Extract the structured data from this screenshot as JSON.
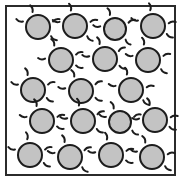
{
  "diagram": {
    "title": "",
    "particle_count": 18,
    "row_counts": [
      4,
      3,
      3,
      4,
      4
    ],
    "colors": {
      "background": "#ffffff",
      "container_fill": "#ffffff",
      "container_stroke": "#2b2b2b",
      "particle_fill": "#c3c3c3",
      "particle_stroke": "#1c1c1c",
      "vibration_mark": "#1c1c1c"
    },
    "container": {
      "x": 5,
      "y": 5,
      "width": 171,
      "height": 171,
      "stroke_width": 2
    },
    "particle_style": {
      "radius": 12,
      "stroke_width": 2
    },
    "vibration_style": {
      "mark_stroke_width": 2,
      "mark_length": 7,
      "marks_per_particle": 4
    },
    "particles": [
      {
        "id": "p1",
        "row": 1,
        "cx": 38,
        "cy": 27,
        "r": 12,
        "marks": [
          200,
          250,
          340,
          35
        ]
      },
      {
        "id": "p2",
        "row": 1,
        "cx": 75,
        "cy": 26,
        "r": 12,
        "marks": [
          195,
          255,
          345,
          40
        ]
      },
      {
        "id": "p3",
        "row": 1,
        "cx": 115,
        "cy": 29,
        "r": 11,
        "marks": [
          190,
          250,
          335,
          45
        ]
      },
      {
        "id": "p4",
        "row": 1,
        "cx": 153,
        "cy": 26,
        "r": 12,
        "marks": [
          200,
          260,
          350,
          30
        ]
      },
      {
        "id": "p5",
        "row": 2,
        "cx": 61,
        "cy": 60,
        "r": 12,
        "marks": [
          185,
          245,
          340,
          20
        ]
      },
      {
        "id": "p6",
        "row": 2,
        "cx": 105,
        "cy": 59,
        "r": 12,
        "marks": [
          190,
          250,
          330,
          25
        ]
      },
      {
        "id": "p7",
        "row": 2,
        "cx": 148,
        "cy": 60,
        "r": 12,
        "marks": [
          195,
          255,
          345,
          35
        ]
      },
      {
        "id": "p8",
        "row": 3,
        "cx": 33,
        "cy": 90,
        "r": 12,
        "marks": [
          200,
          250,
          340,
          30
        ]
      },
      {
        "id": "p9",
        "row": 3,
        "cx": 81,
        "cy": 91,
        "r": 12,
        "marks": [
          190,
          245,
          335,
          25
        ]
      },
      {
        "id": "p10",
        "row": 3,
        "cx": 131,
        "cy": 90,
        "r": 12,
        "marks": [
          195,
          255,
          350,
          40
        ]
      },
      {
        "id": "p11",
        "row": 4,
        "cx": 42,
        "cy": 121,
        "r": 12,
        "marks": [
          195,
          250,
          345,
          20
        ]
      },
      {
        "id": "p12",
        "row": 4,
        "cx": 83,
        "cy": 121,
        "r": 12,
        "marks": [
          190,
          255,
          335,
          30
        ]
      },
      {
        "id": "p13",
        "row": 4,
        "cx": 120,
        "cy": 122,
        "r": 11,
        "marks": [
          200,
          245,
          340,
          35
        ]
      },
      {
        "id": "p14",
        "row": 4,
        "cx": 155,
        "cy": 120,
        "r": 12,
        "marks": [
          185,
          250,
          350,
          25
        ]
      },
      {
        "id": "p15",
        "row": 5,
        "cx": 30,
        "cy": 155,
        "r": 12,
        "marks": [
          200,
          260,
          340,
          30
        ]
      },
      {
        "id": "p16",
        "row": 5,
        "cx": 70,
        "cy": 157,
        "r": 12,
        "marks": [
          195,
          250,
          335,
          40
        ]
      },
      {
        "id": "p17",
        "row": 5,
        "cx": 111,
        "cy": 155,
        "r": 12,
        "marks": [
          190,
          255,
          345,
          20
        ]
      },
      {
        "id": "p18",
        "row": 5,
        "cx": 152,
        "cy": 157,
        "r": 12,
        "marks": [
          200,
          245,
          350,
          35
        ]
      }
    ]
  }
}
